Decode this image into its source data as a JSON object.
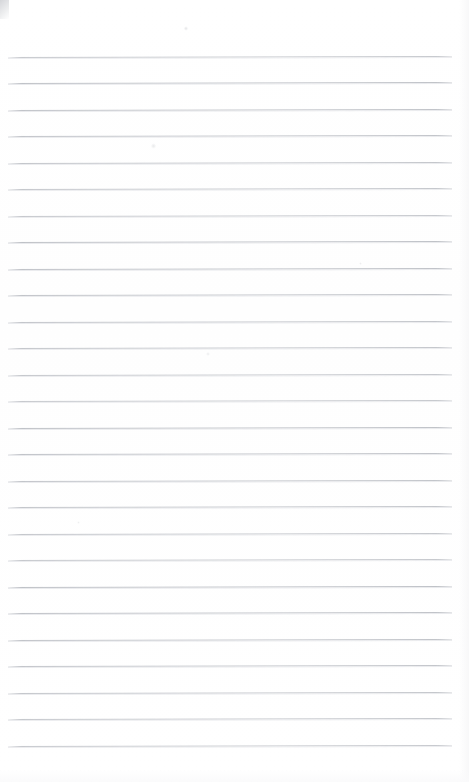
{
  "document": {
    "kind": "scanned-lined-paper",
    "title": "Blank lined notepad page",
    "page_width": 469,
    "page_height": 782,
    "background_color": "#ffffff",
    "is_blank": true,
    "written_text": []
  },
  "ruling": {
    "line_color": "#b9bcc2",
    "line_shadow_color": "#e8e9ec",
    "line_thickness": 1,
    "line_count": 27,
    "left_x": 8,
    "right_x": 452,
    "first_line_y": 56.5,
    "spacing": 26.5,
    "tilt_degrees": -0.12,
    "margin_rule": false,
    "holes": false,
    "lines": [
      {
        "index": 1,
        "y": 56.5,
        "x1": 8,
        "x2": 452
      },
      {
        "index": 2,
        "y": 83.0,
        "x1": 8,
        "x2": 452
      },
      {
        "index": 3,
        "y": 109.5,
        "x1": 8,
        "x2": 452
      },
      {
        "index": 4,
        "y": 136.0,
        "x1": 8,
        "x2": 452
      },
      {
        "index": 5,
        "y": 162.5,
        "x1": 8,
        "x2": 452
      },
      {
        "index": 6,
        "y": 189.0,
        "x1": 8,
        "x2": 452
      },
      {
        "index": 7,
        "y": 215.5,
        "x1": 8,
        "x2": 452
      },
      {
        "index": 8,
        "y": 242.0,
        "x1": 8,
        "x2": 452
      },
      {
        "index": 9,
        "y": 268.5,
        "x1": 8,
        "x2": 452
      },
      {
        "index": 10,
        "y": 295.0,
        "x1": 8,
        "x2": 452
      },
      {
        "index": 11,
        "y": 321.5,
        "x1": 8,
        "x2": 452
      },
      {
        "index": 12,
        "y": 348.0,
        "x1": 8,
        "x2": 452
      },
      {
        "index": 13,
        "y": 374.5,
        "x1": 8,
        "x2": 452
      },
      {
        "index": 14,
        "y": 401.0,
        "x1": 8,
        "x2": 452
      },
      {
        "index": 15,
        "y": 427.5,
        "x1": 8,
        "x2": 452
      },
      {
        "index": 16,
        "y": 454.0,
        "x1": 8,
        "x2": 452
      },
      {
        "index": 17,
        "y": 480.5,
        "x1": 8,
        "x2": 452
      },
      {
        "index": 18,
        "y": 507.0,
        "x1": 8,
        "x2": 452
      },
      {
        "index": 19,
        "y": 533.5,
        "x1": 8,
        "x2": 452
      },
      {
        "index": 20,
        "y": 560.0,
        "x1": 8,
        "x2": 452
      },
      {
        "index": 21,
        "y": 586.5,
        "x1": 8,
        "x2": 452
      },
      {
        "index": 22,
        "y": 613.0,
        "x1": 8,
        "x2": 452
      },
      {
        "index": 23,
        "y": 639.5,
        "x1": 8,
        "x2": 452
      },
      {
        "index": 24,
        "y": 666.0,
        "x1": 8,
        "x2": 452
      },
      {
        "index": 25,
        "y": 692.5,
        "x1": 8,
        "x2": 452
      },
      {
        "index": 26,
        "y": 719.0,
        "x1": 8,
        "x2": 452
      },
      {
        "index": 27,
        "y": 745.5,
        "x1": 8,
        "x2": 452
      }
    ]
  },
  "artifacts": [
    {
      "name": "corner-smudge",
      "x": 0,
      "y": 0,
      "w": 9,
      "h": 19,
      "opacity": 0.85
    },
    {
      "name": "speck-top",
      "x": 184,
      "y": 26,
      "w": 4,
      "h": 5,
      "opacity": 0.32
    },
    {
      "name": "speck-upper",
      "x": 151,
      "y": 143,
      "w": 5,
      "h": 6,
      "opacity": 0.26
    },
    {
      "name": "speck-mid",
      "x": 206,
      "y": 352,
      "w": 4,
      "h": 4,
      "opacity": 0.22
    },
    {
      "name": "speck-lower",
      "x": 359,
      "y": 262,
      "w": 3,
      "h": 3,
      "opacity": 0.2
    },
    {
      "name": "speck-left",
      "x": 77,
      "y": 521,
      "w": 3,
      "h": 3,
      "opacity": 0.18
    }
  ]
}
